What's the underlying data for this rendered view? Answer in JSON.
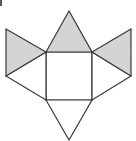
{
  "diagram": {
    "colors": {
      "stroke": "#3a3a3a",
      "shaded_fill": "#d4d4d4",
      "unshaded_fill": "#ffffff",
      "background": "#ffffff"
    },
    "shapes": [
      {
        "id": "center-square",
        "type": "square",
        "points": [
          [
            46,
            52
          ],
          [
            92,
            52
          ],
          [
            92,
            100
          ],
          [
            46,
            100
          ]
        ],
        "shaded": false
      },
      {
        "id": "top-triangle",
        "type": "triangle",
        "points": [
          [
            46,
            52
          ],
          [
            69,
            11
          ],
          [
            92,
            52
          ]
        ],
        "shaded": true
      },
      {
        "id": "left-upper-triangle",
        "type": "triangle",
        "points": [
          [
            6,
            29
          ],
          [
            46,
            52
          ],
          [
            6,
            76
          ]
        ],
        "shaded": true
      },
      {
        "id": "right-upper-triangle",
        "type": "triangle",
        "points": [
          [
            131,
            29
          ],
          [
            92,
            52
          ],
          [
            131,
            76
          ]
        ],
        "shaded": true
      },
      {
        "id": "left-lower-triangle",
        "type": "triangle",
        "points": [
          [
            6,
            76
          ],
          [
            46,
            52
          ],
          [
            46,
            100
          ]
        ],
        "shaded": false
      },
      {
        "id": "right-lower-triangle",
        "type": "triangle",
        "points": [
          [
            131,
            76
          ],
          [
            92,
            52
          ],
          [
            92,
            100
          ]
        ],
        "shaded": false
      },
      {
        "id": "bottom-triangle",
        "type": "triangle",
        "points": [
          [
            46,
            100
          ],
          [
            69,
            140
          ],
          [
            92,
            100
          ]
        ],
        "shaded": false
      }
    ]
  }
}
